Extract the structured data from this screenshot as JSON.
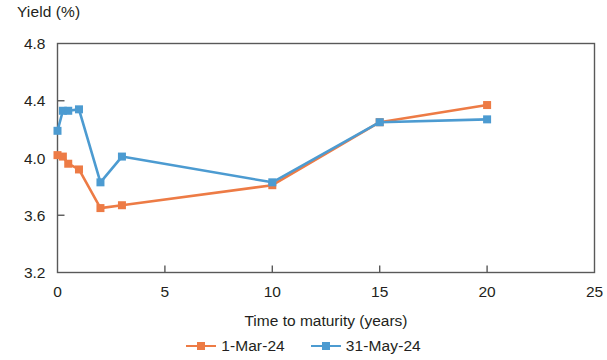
{
  "chart_data": {
    "type": "line",
    "title": "",
    "ylabel": "Yield (%)",
    "xlabel": "Time to maturity (years)",
    "xlim": [
      0,
      25
    ],
    "ylim": [
      3.2,
      4.8
    ],
    "xticks": [
      "0",
      "5",
      "10",
      "15",
      "20",
      "25"
    ],
    "xtick_values": [
      0,
      5,
      10,
      15,
      20,
      25
    ],
    "yticks": [
      "3.2",
      "3.6",
      "4.0",
      "4.4",
      "4.8"
    ],
    "ytick_values": [
      3.2,
      3.6,
      4.0,
      4.4,
      4.8
    ],
    "grid": false,
    "legend_position": "bottom-center",
    "series": [
      {
        "name": "1-Mar-24",
        "color": "#ED7B45",
        "x": [
          0,
          0.25,
          0.5,
          1,
          2,
          3,
          10,
          15,
          20
        ],
        "values": [
          4.02,
          4.01,
          3.96,
          3.92,
          3.65,
          3.67,
          3.81,
          4.25,
          4.37
        ]
      },
      {
        "name": "31-May-24",
        "color": "#4C9BD1",
        "x": [
          0,
          0.25,
          0.5,
          1,
          2,
          3,
          10,
          15,
          20
        ],
        "values": [
          4.19,
          4.33,
          4.33,
          4.34,
          3.83,
          4.01,
          3.83,
          4.25,
          4.27
        ]
      }
    ]
  },
  "axes": {
    "y_title": "Yield (%)",
    "x_title": "Time to maturity (years)"
  },
  "legend": {
    "items": [
      {
        "label": "1-Mar-24",
        "color": "#ED7B45"
      },
      {
        "label": "31-May-24",
        "color": "#4C9BD1"
      }
    ]
  },
  "colors": {
    "series_1": "#ED7B45",
    "series_2": "#4C9BD1",
    "axis": "#595959",
    "text": "#231f20"
  }
}
